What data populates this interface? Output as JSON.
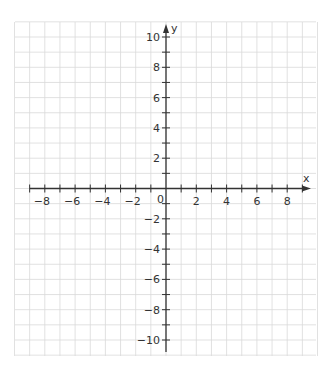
{
  "chart_data": {
    "type": "coordinate-plane",
    "title": "",
    "xlabel": "x",
    "ylabel": "y",
    "xlim": [
      -10,
      10
    ],
    "ylim": [
      -11,
      11
    ],
    "grid": true,
    "grid_step": 1,
    "label_step": 2,
    "origin_label": "0",
    "x_tick_labels": [
      "−8",
      "−6",
      "−4",
      "−2",
      "2",
      "4",
      "6",
      "8"
    ],
    "x_tick_values": [
      -8,
      -6,
      -4,
      -2,
      2,
      4,
      6,
      8
    ],
    "y_tick_labels": [
      "10",
      "8",
      "6",
      "4",
      "2",
      "−2",
      "−4",
      "−6",
      "−8",
      "−10"
    ],
    "y_tick_values": [
      10,
      8,
      6,
      4,
      2,
      -2,
      -4,
      -6,
      -8,
      -10
    ],
    "series": []
  },
  "colors": {
    "grid": "#d9d9d9",
    "axis": "#333333",
    "text": "#333333",
    "background": "#ffffff"
  },
  "layout": {
    "origin_px": [
      166,
      188.5
    ],
    "unit_px": 15.15,
    "grid_left": 15,
    "grid_right": 316,
    "grid_top": 22,
    "grid_bottom": 356
  }
}
